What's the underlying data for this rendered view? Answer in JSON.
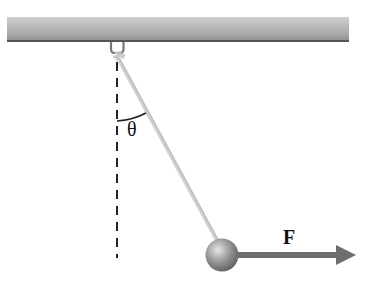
{
  "diagram": {
    "type": "pendulum-force-diagram",
    "labels": {
      "angle": "θ",
      "force": "F"
    },
    "colors": {
      "ceiling_light": "#bdbdbd",
      "ceiling_dark": "#8a8a8a",
      "string": "#d4d4d4",
      "bob": "#8c8c8c",
      "arrow": "#6e6e6e",
      "dashed_line": "#222222"
    }
  }
}
